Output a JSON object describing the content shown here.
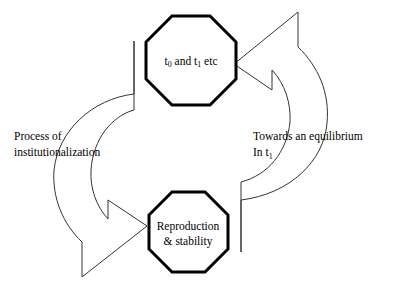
{
  "diagram": {
    "background_color": "#ffffff",
    "stroke_color": "#000000",
    "arrow_stroke_color": "#333333",
    "nodes": [
      {
        "id": "node-top",
        "shape": "octagon",
        "line1_pre": "t",
        "line1_sub1": "0",
        "line1_mid": " and t",
        "line1_sub2": "1",
        "line1_post": " etc",
        "full_text": "t0 and t1 etc"
      },
      {
        "id": "node-bottom",
        "shape": "octagon",
        "line1": "Reproduction",
        "line2": "& stability",
        "full_text": "Reproduction & stability"
      }
    ],
    "labels": [
      {
        "id": "label-left",
        "line1": "Process of",
        "line2": "institutionalization"
      },
      {
        "id": "label-right",
        "line1": "Towards an equilibrium",
        "line2_pre": "In t",
        "line2_sub": "1",
        "full_line2": "In t1"
      }
    ],
    "arrows": [
      {
        "id": "arrow-left-down",
        "direction": "counterclockwise",
        "from": "node-top",
        "to": "node-bottom",
        "label_ref": "label-left"
      },
      {
        "id": "arrow-right-up",
        "direction": "counterclockwise",
        "from": "node-bottom",
        "to": "node-top",
        "label_ref": "label-right"
      }
    ]
  }
}
